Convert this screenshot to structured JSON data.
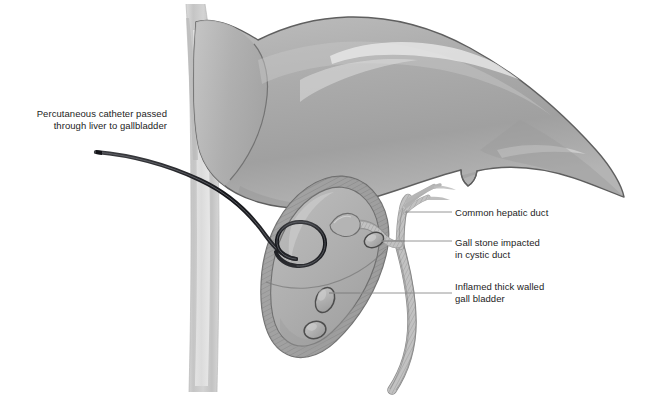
{
  "figure": {
    "background_color": "#ffffff"
  },
  "labels": {
    "catheter": "Percutaneous catheter passed\nthrough liver to gallbladder",
    "common_hepatic_duct": "Common hepatic duct",
    "gall_stone": "Gall stone impacted\nin cystic duct",
    "gall_bladder": "Inflamed thick walled\ngall bladder"
  },
  "palette": {
    "liver_fill": "#a9a9a9",
    "liver_fill_light": "#c2c2c2",
    "liver_highlight": "#e4e4e4",
    "liver_outline": "#5b5b5b",
    "gallbladder_wall": "#9b9b9b",
    "gallbladder_lumen": "#b9b9b9",
    "duct_fill": "#b3b3b3",
    "duct_outline": "#6e6e6e",
    "abdominal_wall": "#bdbdbd",
    "abdominal_wall_light": "#d6d6d6",
    "catheter": "#16171a",
    "stone_fill": "#b0b0b0",
    "stone_outline": "#4e4e4e",
    "leader_line": "#8d8d8d",
    "text": "#1d1d1d"
  },
  "parts": {
    "liver": "liver",
    "gallbladder": "inflamed thick walled gall bladder",
    "common_hepatic_duct": "common hepatic duct",
    "cystic_duct": "cystic duct",
    "common_bile_duct": "common bile duct",
    "catheter": "percutaneous catheter with pigtail coil",
    "abdominal_wall": "abdominal wall",
    "stones": "gall stones"
  }
}
